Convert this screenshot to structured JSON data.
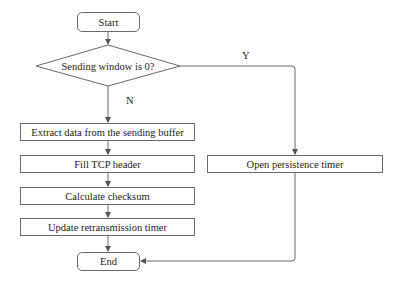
{
  "diagram": {
    "type": "flowchart",
    "nodes": {
      "start": {
        "label": "Start",
        "shape": "rounded-rect"
      },
      "decision": {
        "label": "Sending window is 0?",
        "shape": "diamond"
      },
      "extract": {
        "label": "Extract data from the sending buffer",
        "shape": "rect"
      },
      "fill_header": {
        "label": "Fill TCP header",
        "shape": "rect"
      },
      "checksum": {
        "label": "Calculate checksum",
        "shape": "rect"
      },
      "update_timer": {
        "label": "Update retransmission timer",
        "shape": "rect"
      },
      "persistence": {
        "label": "Open persistence timer",
        "shape": "rect"
      },
      "end": {
        "label": "End",
        "shape": "rounded-rect"
      }
    },
    "edge_labels": {
      "yes": "Y",
      "no": "N"
    },
    "edges": [
      {
        "from": "start",
        "to": "decision"
      },
      {
        "from": "decision",
        "to": "extract",
        "label": "N"
      },
      {
        "from": "decision",
        "to": "persistence",
        "label": "Y"
      },
      {
        "from": "extract",
        "to": "fill_header"
      },
      {
        "from": "fill_header",
        "to": "checksum"
      },
      {
        "from": "checksum",
        "to": "update_timer"
      },
      {
        "from": "update_timer",
        "to": "end"
      },
      {
        "from": "persistence",
        "to": "end"
      }
    ],
    "colors": {
      "stroke": "#6a6a6a",
      "text": "#222222",
      "background": "#ffffff"
    }
  }
}
